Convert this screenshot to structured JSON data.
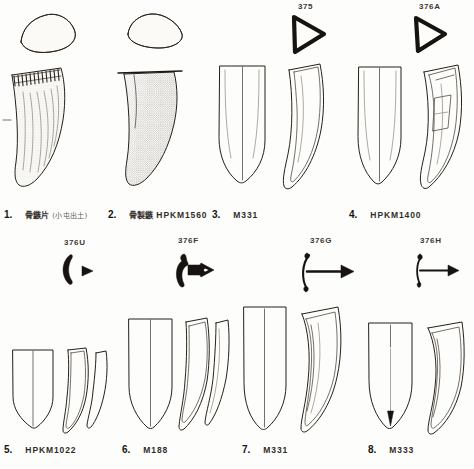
{
  "plate": {
    "title": "Archaeological plate: bone/antler arrowhead and tooth-shaped artifacts",
    "ink_color": "#262018",
    "paper_color": "#fdfdfb"
  },
  "rows": [
    {
      "items": [
        {
          "number": "1.",
          "cjk": "骨鏃片",
          "paren": "(小屯出土)",
          "code": "",
          "spec_code": "",
          "figure": "fang-stippled-with-section"
        },
        {
          "number": "2.",
          "cjk": "骨製鏃",
          "paren": "",
          "code": "HPKM1560",
          "spec_code": "",
          "figure": "fang-dark-stippled-with-section"
        },
        {
          "number": "3.",
          "cjk": "",
          "paren": "",
          "code": "M331",
          "spec_code": "375",
          "figure": "blade-pair-front-profile"
        },
        {
          "number": "4.",
          "cjk": "",
          "paren": "",
          "code": "HPKM1400",
          "spec_code": "376A",
          "figure": "blade-pair-front-profile-tang"
        }
      ]
    },
    {
      "items": [
        {
          "number": "5.",
          "cjk": "",
          "paren": "",
          "code": "HPKM1022",
          "spec_code": "376U",
          "figure": "blade-triple-crescent-section"
        },
        {
          "number": "6.",
          "cjk": "",
          "paren": "",
          "code": "M188",
          "spec_code": "376F",
          "figure": "blade-triple-anchor-section"
        },
        {
          "number": "7.",
          "cjk": "",
          "paren": "",
          "code": "M331",
          "spec_code": "376G",
          "figure": "blade-pair-bow-arrow-section"
        },
        {
          "number": "8.",
          "cjk": "",
          "paren": "",
          "code": "M333",
          "spec_code": "376H",
          "figure": "blade-pair-bow-arrow-small-section"
        }
      ]
    }
  ]
}
